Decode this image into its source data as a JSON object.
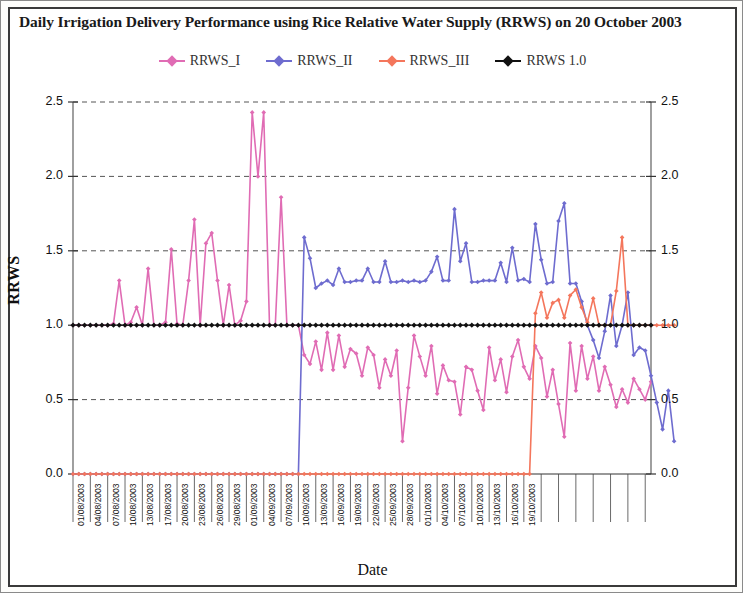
{
  "chart_data": {
    "type": "line",
    "title": "Daily Irrigation Delivery Performance using Rice Relative Water Supply (RRWS) on 20 October 2003",
    "xlabel": "Date",
    "ylabel": "RRWS",
    "ylim": [
      0.0,
      2.5
    ],
    "ytick_labels": [
      "0.0",
      "0.5",
      "1.0",
      "1.5",
      "2.0",
      "2.5"
    ],
    "ytick_values": [
      0.0,
      0.5,
      1.0,
      1.5,
      2.0,
      2.5
    ],
    "grid": true,
    "legend_position": "top-center",
    "x_start_date": "01/08/2003",
    "x_end_date": "19/10/2003",
    "x_tick_interval_days": 3,
    "xtick_labels": [
      "01/08/2003",
      "04/08/2003",
      "07/08/2003",
      "10/08/2003",
      "13/08/2003",
      "17/08/2003",
      "20/08/2003",
      "23/08/2003",
      "26/08/2003",
      "29/08/2003",
      "01/09/2003",
      "04/09/2003",
      "07/09/2003",
      "10/09/2003",
      "13/09/2003",
      "16/09/2003",
      "19/09/2003",
      "22/09/2003",
      "25/09/2003",
      "28/09/2003",
      "01/10/2003",
      "04/10/2003",
      "07/10/2003",
      "10/10/2003",
      "13/10/2003",
      "16/10/2003",
      "19/10/2003"
    ],
    "series": [
      {
        "name": "RRWS_I",
        "color": "#e06cb4",
        "marker": "diamond",
        "values": [
          1.0,
          1.0,
          1.0,
          1.0,
          1.0,
          1.0,
          1.0,
          1.01,
          1.3,
          1.0,
          1.02,
          1.12,
          1.0,
          1.38,
          1.0,
          1.0,
          1.02,
          1.51,
          1.01,
          1.0,
          1.3,
          1.71,
          1.0,
          1.55,
          1.62,
          1.3,
          1.0,
          1.27,
          1.0,
          1.03,
          1.16,
          2.43,
          2.0,
          2.43,
          1.0,
          1.0,
          1.86,
          1.0,
          1.0,
          1.0,
          0.8,
          0.74,
          0.89,
          0.7,
          0.95,
          0.7,
          0.93,
          0.72,
          0.84,
          0.81,
          0.66,
          0.85,
          0.8,
          0.58,
          0.77,
          0.66,
          0.83,
          0.22,
          0.58,
          0.93,
          0.79,
          0.66,
          0.86,
          0.54,
          0.73,
          0.63,
          0.62,
          0.4,
          0.72,
          0.7,
          0.56,
          0.43,
          0.85,
          0.63,
          0.77,
          0.55,
          0.79,
          0.9,
          0.72,
          0.64,
          0.86,
          0.78,
          0.52,
          0.7,
          0.47,
          0.25,
          0.88,
          0.56,
          0.86,
          0.64,
          0.79,
          0.56,
          0.72,
          0.6,
          0.45,
          0.57,
          0.48,
          0.64,
          0.57,
          0.5,
          0.62
        ]
      },
      {
        "name": "RRWS_II",
        "color": "#6e6ccf",
        "marker": "diamond",
        "values": [
          0.0,
          0.0,
          0.0,
          0.0,
          0.0,
          0.0,
          0.0,
          0.0,
          0.0,
          0.0,
          0.0,
          0.0,
          0.0,
          0.0,
          0.0,
          0.0,
          0.0,
          0.0,
          0.0,
          0.0,
          0.0,
          0.0,
          0.0,
          0.0,
          0.0,
          0.0,
          0.0,
          0.0,
          0.0,
          0.0,
          0.0,
          0.0,
          0.0,
          0.0,
          0.0,
          0.0,
          0.0,
          0.0,
          0.0,
          0.0,
          1.59,
          1.45,
          1.25,
          1.28,
          1.3,
          1.27,
          1.38,
          1.29,
          1.29,
          1.3,
          1.3,
          1.38,
          1.29,
          1.29,
          1.43,
          1.29,
          1.29,
          1.3,
          1.29,
          1.3,
          1.29,
          1.3,
          1.36,
          1.46,
          1.3,
          1.3,
          1.78,
          1.43,
          1.55,
          1.29,
          1.29,
          1.3,
          1.3,
          1.3,
          1.42,
          1.29,
          1.52,
          1.3,
          1.31,
          1.29,
          1.68,
          1.44,
          1.28,
          1.29,
          1.7,
          1.82,
          1.28,
          1.28,
          1.16,
          1.0,
          0.9,
          0.78,
          0.96,
          1.2,
          0.86,
          1.0,
          1.22,
          0.8,
          0.85,
          0.83,
          0.66,
          0.48,
          0.3,
          0.56,
          0.22
        ]
      },
      {
        "name": "RRWS_III",
        "color": "#f4765c",
        "marker": "diamond",
        "values": [
          0.0,
          0.0,
          0.0,
          0.0,
          0.0,
          0.0,
          0.0,
          0.0,
          0.0,
          0.0,
          0.0,
          0.0,
          0.0,
          0.0,
          0.0,
          0.0,
          0.0,
          0.0,
          0.0,
          0.0,
          0.0,
          0.0,
          0.0,
          0.0,
          0.0,
          0.0,
          0.0,
          0.0,
          0.0,
          0.0,
          0.0,
          0.0,
          0.0,
          0.0,
          0.0,
          0.0,
          0.0,
          0.0,
          0.0,
          0.0,
          0.0,
          0.0,
          0.0,
          0.0,
          0.0,
          0.0,
          0.0,
          0.0,
          0.0,
          0.0,
          0.0,
          0.0,
          0.0,
          0.0,
          0.0,
          0.0,
          0.0,
          0.0,
          0.0,
          0.0,
          0.0,
          0.0,
          0.0,
          0.0,
          0.0,
          0.0,
          0.0,
          0.0,
          0.0,
          0.0,
          0.0,
          0.0,
          0.0,
          0.0,
          0.0,
          0.0,
          0.0,
          0.0,
          0.0,
          0.0,
          1.08,
          1.22,
          1.05,
          1.15,
          1.17,
          1.05,
          1.2,
          1.24,
          1.12,
          1.02,
          1.18,
          1.0,
          1.0,
          1.0,
          1.23,
          1.59,
          1.0,
          1.0,
          1.0,
          1.0,
          1.0,
          1.0,
          1.0,
          1.0,
          1.0
        ]
      },
      {
        "name": "RRWS 1.0",
        "color": "#111111",
        "marker": "diamond",
        "constant": 1.0
      }
    ]
  },
  "legend": {
    "items": [
      {
        "label": "RRWS_I",
        "color": "#e06cb4"
      },
      {
        "label": "RRWS_II",
        "color": "#6e6ccf"
      },
      {
        "label": "RRWS_III",
        "color": "#f4765c"
      },
      {
        "label": "RRWS 1.0",
        "color": "#111111"
      }
    ]
  }
}
